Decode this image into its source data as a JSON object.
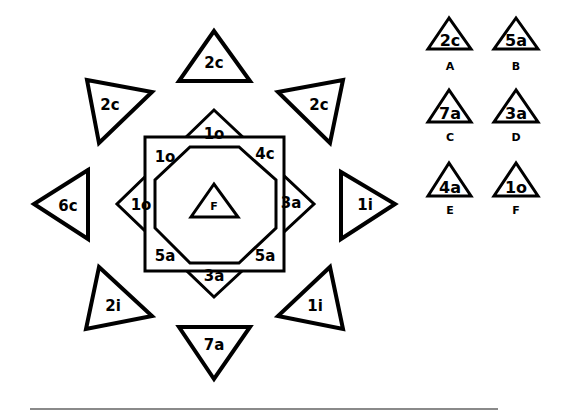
{
  "diagram": {
    "outer_triangles": [
      {
        "position": "top",
        "label": "2c"
      },
      {
        "position": "upper-right",
        "label": "2c"
      },
      {
        "position": "right",
        "label": "1i"
      },
      {
        "position": "lower-right",
        "label": "1i"
      },
      {
        "position": "bottom",
        "label": "7a"
      },
      {
        "position": "lower-left",
        "label": "2i"
      },
      {
        "position": "left",
        "label": "6c"
      },
      {
        "position": "upper-left",
        "label": "2c"
      }
    ],
    "star_points": [
      {
        "position": "top",
        "label": "1o"
      },
      {
        "position": "upper-right",
        "label": "4c"
      },
      {
        "position": "right",
        "label": "3a"
      },
      {
        "position": "lower-right",
        "label": "5a"
      },
      {
        "position": "bottom",
        "label": "3a"
      },
      {
        "position": "lower-left",
        "label": "5a"
      },
      {
        "position": "left",
        "label": "1o"
      },
      {
        "position": "upper-left",
        "label": "1o"
      }
    ],
    "center": {
      "label": "F"
    }
  },
  "options": [
    {
      "letter": "A",
      "label": "2c"
    },
    {
      "letter": "B",
      "label": "5a"
    },
    {
      "letter": "C",
      "label": "7a"
    },
    {
      "letter": "D",
      "label": "3a"
    },
    {
      "letter": "E",
      "label": "4a"
    },
    {
      "letter": "F",
      "label": "1o"
    }
  ],
  "colors": {
    "stroke": "#000000",
    "background": "#ffffff",
    "rule": "#8a8a8a"
  }
}
